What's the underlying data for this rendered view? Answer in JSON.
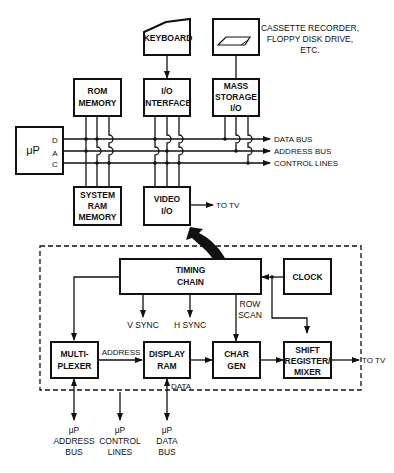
{
  "top": {
    "keyboard": "KEYBOARD",
    "mass_storage_device_caption": [
      "CASSETTE RECORDER,",
      "FLOPPY DISK DRIVE,",
      "ETC."
    ],
    "rom_memory": [
      "ROM",
      "MEMORY"
    ],
    "io_interface": [
      "I/O",
      "INTERFACE"
    ],
    "mass_storage_io": [
      "MASS",
      "STORAGE",
      "I/O"
    ],
    "microprocessor": "μP",
    "bus_letters": [
      "D",
      "A",
      "C"
    ],
    "system_ram": [
      "SYSTEM",
      "RAM",
      "MEMORY"
    ],
    "video_io": [
      "VIDEO",
      "I/O"
    ],
    "video_to_tv": "TO TV",
    "buses": [
      "DATA BUS",
      "ADDRESS BUS",
      "CONTROL LINES"
    ]
  },
  "detail": {
    "timing_chain": [
      "TIMING",
      "CHAIN"
    ],
    "clock": "CLOCK",
    "v_sync": "V SYNC",
    "h_sync": "H SYNC",
    "row_scan": [
      "ROW",
      "SCAN"
    ],
    "multiplexer": [
      "MULTI-",
      "PLEXER"
    ],
    "address_label": "ADDRESS",
    "display_ram": [
      "DISPLAY",
      "RAM"
    ],
    "data_label": "DATA",
    "char_gen": [
      "CHAR",
      "GEN"
    ],
    "shift_register": [
      "SHIFT",
      "REGISTER/",
      "MIXER"
    ],
    "to_tv": "TO TV",
    "bottom_inputs": [
      [
        "μP",
        "ADDRESS",
        "BUS"
      ],
      [
        "μP",
        "CONTROL",
        "LINES"
      ],
      [
        "μP",
        "DATA",
        "BUS"
      ]
    ]
  },
  "colors": {
    "ink": "#111111",
    "paper": "#ffffff"
  }
}
